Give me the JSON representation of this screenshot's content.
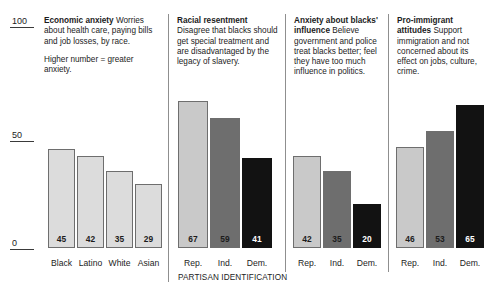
{
  "chart_data": {
    "type": "bar",
    "title": "",
    "xlabel": "PARTISAN IDENTIFICATION",
    "ylabel": "",
    "ylim": [
      0,
      100
    ],
    "yticks": [
      "0",
      "50",
      "100"
    ],
    "grid": false,
    "legend": "none",
    "panels": [
      {
        "heading": "Economic anxiety",
        "description": "Worries about health care, paying bills and job losses, by race.",
        "note": "Higher number = greater anxiety.",
        "categories": [
          "Black",
          "Latino",
          "White",
          "Asian"
        ],
        "values": [
          45,
          42,
          35,
          29
        ],
        "colors": [
          "#dcdcdc",
          "#dcdcdc",
          "#dcdcdc",
          "#dcdcdc"
        ],
        "label_colors": [
          "#1c1c1c",
          "#1c1c1c",
          "#1c1c1c",
          "#1c1c1c"
        ]
      },
      {
        "heading": "Racial resentment",
        "description": "Disagree that blacks should get special treatment and are disadvantaged by the legacy of slavery.",
        "note": "",
        "categories": [
          "Rep.",
          "Ind.",
          "Dem."
        ],
        "values": [
          67,
          59,
          41
        ],
        "colors": [
          "#c9c9c9",
          "#6e6e6e",
          "#121212"
        ],
        "label_colors": [
          "#1c1c1c",
          "#1c1c1c",
          "#ffffff"
        ]
      },
      {
        "heading": "Anxiety about blacks' influence",
        "description": "Believe government and police treat blacks better; feel they have too much influence in politics.",
        "note": "",
        "categories": [
          "Rep.",
          "Ind.",
          "Dem."
        ],
        "values": [
          42,
          35,
          20
        ],
        "colors": [
          "#c9c9c9",
          "#6e6e6e",
          "#121212"
        ],
        "label_colors": [
          "#1c1c1c",
          "#1c1c1c",
          "#ffffff"
        ]
      },
      {
        "heading": "Pro-immigrant attitudes",
        "description": "Support immigration and not concerned about its effect on jobs, culture, crime.",
        "note": "",
        "categories": [
          "Rep.",
          "Ind.",
          "Dem."
        ],
        "values": [
          46,
          53,
          65
        ],
        "colors": [
          "#c9c9c9",
          "#6e6e6e",
          "#121212"
        ],
        "label_colors": [
          "#1c1c1c",
          "#1c1c1c",
          "#ffffff"
        ]
      }
    ]
  }
}
